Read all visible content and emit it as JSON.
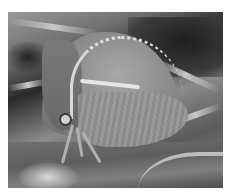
{
  "image": {
    "description": "Grayscale close-up photograph of a treehopper insect with a large dome-shaped pronotum perched on a plant stem",
    "subject": "treehopper insect",
    "colors": {
      "background": "#ffffff",
      "dark_background": "#1e1e1e",
      "shell": "#8a8a8a",
      "ridge_highlight": "#e0e0e0",
      "stem": "#5e5e5e"
    }
  }
}
